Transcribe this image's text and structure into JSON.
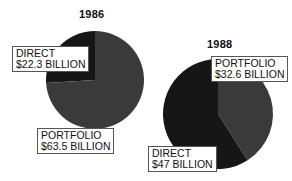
{
  "chart_data": [
    {
      "type": "pie",
      "title": "1986",
      "slices": [
        {
          "name": "DIRECT",
          "value": 22.3,
          "label": "$22.3 BILLION",
          "color": "#161616"
        },
        {
          "name": "PORTFOLIO",
          "value": 63.5,
          "label": "$63.5 BILLION",
          "color": "#3a3a3a"
        }
      ]
    },
    {
      "type": "pie",
      "title": "1988",
      "slices": [
        {
          "name": "PORTFOLIO",
          "value": 32.6,
          "label": "$32.6 BILLION",
          "color": "#3a3a3a"
        },
        {
          "name": "DIRECT",
          "value": 47,
          "label": "$47 BILLION",
          "color": "#161616"
        }
      ]
    }
  ],
  "pie1986": {
    "title": "1986",
    "direct": {
      "name": "DIRECT",
      "amount": "$22.3 BILLION"
    },
    "portfolio": {
      "name": "PORTFOLIO",
      "amount": "$63.5 BILLION"
    }
  },
  "pie1988": {
    "title": "1988",
    "portfolio": {
      "name": "PORTFOLIO",
      "amount": "$32.6 BILLION"
    },
    "direct": {
      "name": "DIRECT",
      "amount": "$47 BILLION"
    }
  }
}
